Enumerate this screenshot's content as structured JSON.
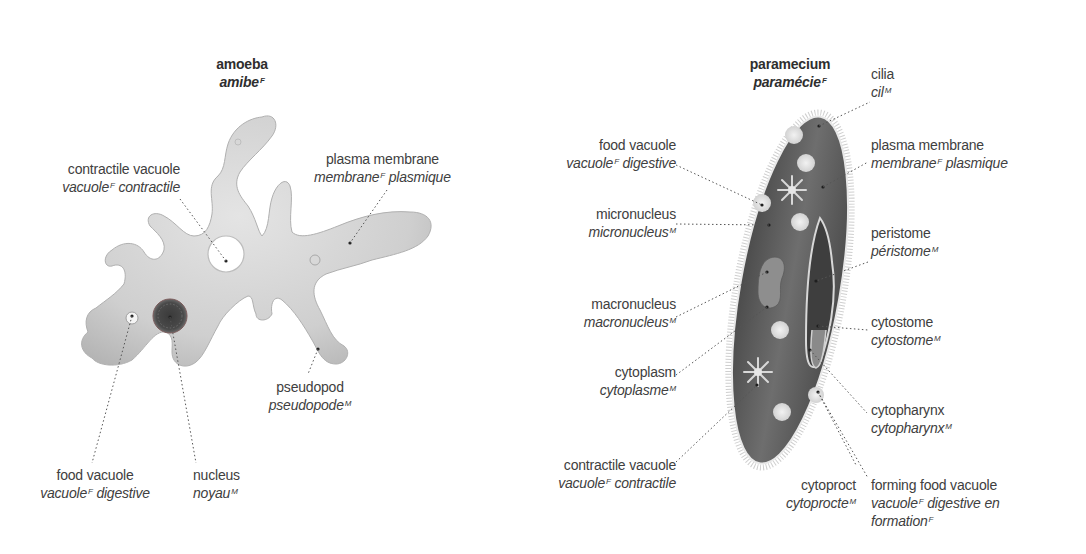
{
  "amoeba": {
    "title": {
      "en": "amoeba",
      "fr": "amibe",
      "gender": "F"
    },
    "labels": {
      "contractile_vacuole": {
        "en": "contractile vacuole",
        "fr_a": "vacuole",
        "gender": "F",
        "fr_b": " contractile"
      },
      "plasma_membrane": {
        "en": "plasma membrane",
        "fr_a": "membrane",
        "gender": "F",
        "fr_b": " plasmique"
      },
      "pseudopod": {
        "en": "pseudopod",
        "fr_a": "pseudopode",
        "gender": "M",
        "fr_b": ""
      },
      "food_vacuole": {
        "en": "food vacuole",
        "fr_a": "vacuole",
        "gender": "F",
        "fr_b": " digestive"
      },
      "nucleus": {
        "en": "nucleus",
        "fr_a": "noyau",
        "gender": "M",
        "fr_b": ""
      }
    }
  },
  "paramecium": {
    "title": {
      "en": "paramecium",
      "fr": "paramécie",
      "gender": "F"
    },
    "labels": {
      "cilia": {
        "en": "cilia",
        "fr_a": "cil",
        "gender": "M",
        "fr_b": ""
      },
      "plasma_membrane": {
        "en": "plasma membrane",
        "fr_a": "membrane",
        "gender": "F",
        "fr_b": " plasmique"
      },
      "food_vacuole": {
        "en": "food vacuole",
        "fr_a": "vacuole",
        "gender": "F",
        "fr_b": " digestive"
      },
      "micronucleus": {
        "en": "micronucleus",
        "fr_a": "micronucleus",
        "gender": "M",
        "fr_b": ""
      },
      "peristome": {
        "en": "peristome",
        "fr_a": "péristome",
        "gender": "M",
        "fr_b": ""
      },
      "macronucleus": {
        "en": "macronucleus",
        "fr_a": "macronucleus",
        "gender": "M",
        "fr_b": ""
      },
      "cytostome": {
        "en": "cytostome",
        "fr_a": "cytostome",
        "gender": "M",
        "fr_b": ""
      },
      "cytoplasm": {
        "en": "cytoplasm",
        "fr_a": "cytoplasme",
        "gender": "M",
        "fr_b": ""
      },
      "cytopharynx": {
        "en": "cytopharynx",
        "fr_a": "cytopharynx",
        "gender": "M",
        "fr_b": ""
      },
      "contractile_vacuole": {
        "en": "contractile vacuole",
        "fr_a": "vacuole",
        "gender": "F",
        "fr_b": " contractile"
      },
      "cytoproct": {
        "en": "cytoproct",
        "fr_a": "cytoprocte",
        "gender": "M",
        "fr_b": ""
      },
      "forming_food_vacuole": {
        "en": "forming food vacuole",
        "fr_a": "vacuole",
        "gender": "F",
        "fr_b": " digestive en",
        "fr_c": "formation",
        "gender_c": "F"
      }
    }
  },
  "colors": {
    "text": "#404040",
    "leader": "#555555",
    "amoeba_body": "#d4d4d4",
    "paramecium_body": "#5e5e5e"
  }
}
